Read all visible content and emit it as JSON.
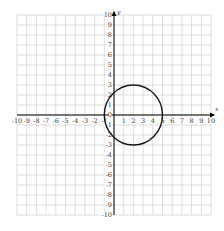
{
  "notes": {
    "top_edge_text": "A line of text is cut off at the top edge of the screenshot; only glyph fragments are visible and it is not legible, so it is not transcribed."
  },
  "chart_data": {
    "type": "line",
    "title": "",
    "xlabel": "x",
    "ylabel": "y",
    "xlim": [
      -10,
      10
    ],
    "ylim": [
      -10,
      10
    ],
    "grid": true,
    "x_tick_labels": [
      "-10",
      "-9",
      "-8",
      "-7",
      "-6",
      "-5",
      "-4",
      "-3",
      "-2",
      "-1",
      "0",
      "1",
      "2",
      "3",
      "4",
      "5",
      "6",
      "7",
      "8",
      "9",
      "10"
    ],
    "y_tick_labels": [
      "10",
      "9",
      "8",
      "7",
      "6",
      "5",
      "4",
      "3",
      "2",
      "1",
      "0",
      "-1",
      "-2",
      "-3",
      "-4",
      "-5",
      "-6",
      "-7",
      "-8",
      "-9",
      "-10"
    ],
    "series": [
      {
        "name": "circle",
        "shape": "circle",
        "center": [
          2,
          0
        ],
        "radius": 3,
        "equation": "(x - 2)^2 + y^2 = 9",
        "key_points": [
          [
            2,
            3
          ],
          [
            2,
            -3
          ],
          [
            -1,
            0
          ],
          [
            5,
            0
          ]
        ]
      }
    ],
    "layout": {
      "plot_left_px": 17,
      "plot_right_px": 211,
      "plot_top_px": 15,
      "plot_bottom_px": 215,
      "origin_px": [
        112,
        114
      ]
    },
    "colors": {
      "grid": "#c8c8c8",
      "axis": "#000000",
      "curve": "#1a1a1a",
      "label": "#333333"
    }
  }
}
